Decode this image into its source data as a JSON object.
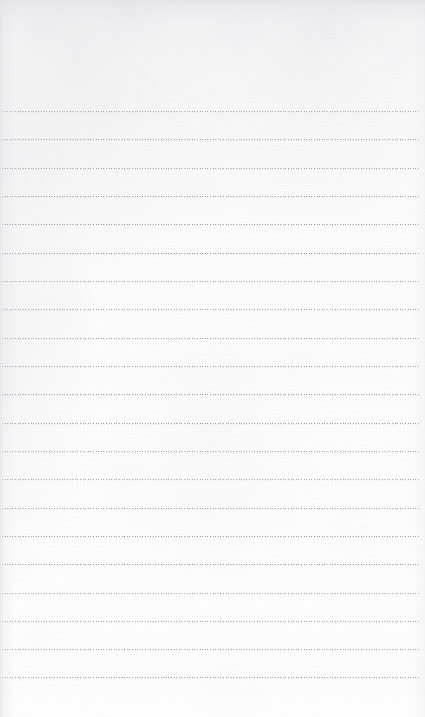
{
  "page": {
    "kind": "lined-paper-sheet",
    "width": 425,
    "height": 717,
    "content_text": "",
    "placeholder": ""
  },
  "paper": {
    "base_color": "#fdfdfd",
    "top_edge_tint": "#e0e0e3",
    "left_edge_tint": "#e2e2e5",
    "bright_corner": "#ffffff",
    "texture": "mottled fibrous paper grain"
  },
  "rules": {
    "count": 21,
    "first_line_y": 111,
    "spacing": 28.3,
    "left_x": 2,
    "right_x": 419,
    "style": "dotted",
    "dot_color": "#8c8c92",
    "dot_period": 2.6,
    "lines_y": [
      111,
      139,
      168,
      196,
      224,
      253,
      281,
      309,
      338,
      366,
      394,
      423,
      451,
      479,
      508,
      536,
      564,
      593,
      621,
      649,
      677
    ]
  }
}
